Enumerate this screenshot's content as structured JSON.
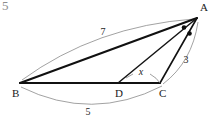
{
  "figure": {
    "kind": "geometry-diagram",
    "corner_mark": "5",
    "vertices": [
      {
        "id": "A",
        "label": "A",
        "x": 197,
        "y": 18,
        "label_x": 200,
        "label_y": 11
      },
      {
        "id": "B",
        "label": "B",
        "x": 20,
        "y": 83,
        "label_x": 12,
        "label_y": 97
      },
      {
        "id": "C",
        "label": "C",
        "x": 160,
        "y": 83,
        "label_x": 159,
        "label_y": 97
      },
      {
        "id": "D",
        "label": "D",
        "x": 118,
        "y": 83,
        "label_x": 115,
        "label_y": 97
      }
    ],
    "segments": [
      {
        "id": "AB",
        "from": "B",
        "to": "A",
        "style": "thick"
      },
      {
        "id": "BC",
        "from": "B",
        "to": "C",
        "style": "thick"
      },
      {
        "id": "AC",
        "from": "C",
        "to": "A",
        "style": "medium"
      },
      {
        "id": "AD",
        "from": "D",
        "to": "A",
        "style": "cevian"
      }
    ],
    "measures": [
      {
        "id": "AB-length",
        "label": "7",
        "for": "AB",
        "x": 103,
        "y": 35,
        "position": "above-left-arc"
      },
      {
        "id": "AC-length",
        "label": "3",
        "for": "AC",
        "x": 186,
        "y": 63,
        "position": "right-arc"
      },
      {
        "id": "BC-length",
        "label": "5",
        "for": "BC",
        "x": 88,
        "y": 115,
        "position": "below-arc"
      },
      {
        "id": "AD-length",
        "label": "x",
        "for": "AD",
        "x": 141,
        "y": 75,
        "position": "interior-leader"
      }
    ],
    "angle_marks": [
      {
        "id": "angle-BAD",
        "at": "A",
        "symbol": "dot",
        "x": 184,
        "y": 27.5
      },
      {
        "id": "angle-DAC",
        "at": "A",
        "symbol": "dot",
        "x": 189.5,
        "y": 33.5
      }
    ],
    "colors": {
      "line": "#111111",
      "arc": "#8a8a8a",
      "text": "#1a1a1a",
      "background": "#ffffff",
      "corner_mark": "#8d8d8d"
    }
  }
}
